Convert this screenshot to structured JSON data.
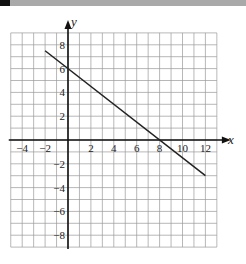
{
  "chart_data": {
    "type": "line",
    "title": "",
    "xlabel": "x",
    "ylabel": "y",
    "xlim": [
      -5,
      13
    ],
    "ylim": [
      -9,
      9
    ],
    "grid": true,
    "x_ticks": [
      -4,
      -2,
      2,
      4,
      6,
      8,
      10,
      12
    ],
    "y_ticks": [
      8,
      6,
      4,
      2,
      -2,
      -4,
      -6,
      -8
    ],
    "x_tick_labels": [
      "−4",
      "−2",
      "2",
      "4",
      "6",
      "8",
      "10",
      "12"
    ],
    "y_tick_labels": [
      "8",
      "6",
      "4",
      "2",
      "−2",
      "−4",
      "−6",
      "−8"
    ],
    "series": [
      {
        "name": "line",
        "equation": "y = -3/4 x + 6",
        "x": [
          -2,
          12
        ],
        "y": [
          7.5,
          -3
        ]
      }
    ],
    "annotations": {
      "y_intercept": 6,
      "x_intercept": 8
    }
  },
  "axes": {
    "x_label": "x",
    "y_label": "y"
  },
  "colors": {
    "grid": "#999999",
    "axis": "#111111",
    "line": "#222222",
    "topbar": "#a9a9a9"
  }
}
